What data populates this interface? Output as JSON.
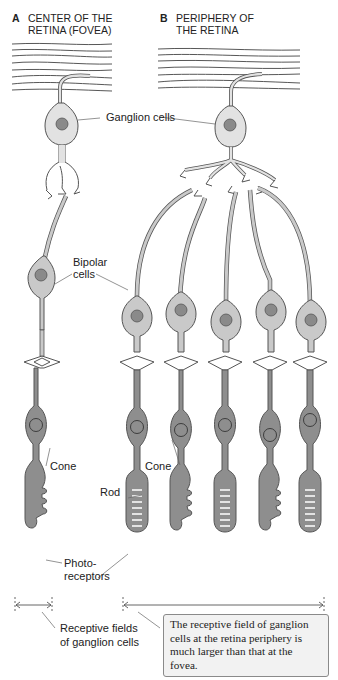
{
  "panels": [
    {
      "letter": "A",
      "title_line1": "CENTER OF THE",
      "title_line2": "RETINA (FOVEA)"
    },
    {
      "letter": "B",
      "title_line1": "PERIPHERY OF",
      "title_line2": "THE RETINA"
    }
  ],
  "labels": {
    "ganglion": "Ganglion cells",
    "bipolar_line1": "Bipolar",
    "bipolar_line2": "cells",
    "cone_a": "Cone",
    "cone_b": "Cone",
    "rod": "Rod",
    "photo_line1": "Photo-",
    "photo_line2": "receptors",
    "receptive_line1": "Receptive fields",
    "receptive_line2": "of ganglion cells"
  },
  "note": "The receptive field of ganglion cells at the retina periphery is much larger than that at the fovea.",
  "colors": {
    "ganglion_fill": "#e2e2e2",
    "bipolar_fill": "#c9c9c9",
    "photoreceptor_fill": "#8e8e8e",
    "nucleus_fill": "#8a8a8a",
    "outline": "#555555",
    "note_bg": "#f2f2f2"
  }
}
